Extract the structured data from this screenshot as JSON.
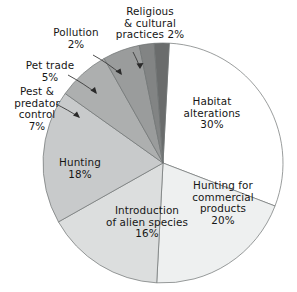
{
  "chart_data": {
    "type": "pie",
    "title": "",
    "subtitle": "",
    "xlabel": "",
    "ylabel": "",
    "legend_position": "none",
    "grid": false,
    "units": "percent",
    "total": 100,
    "start_angle_deg": 3,
    "direction": "clockwise",
    "categories": [
      "Habitat alterations",
      "Hunting for commercial products",
      "Introduction of alien species",
      "Hunting",
      "Pest & predator control",
      "Pet trade",
      "Pollution",
      "Religious & cultural practices"
    ],
    "values": [
      30,
      20,
      16,
      18,
      7,
      5,
      2,
      2
    ],
    "slices": [
      {
        "name": "Habitat alterations",
        "label_line1": "Habitat",
        "label_line2": "alterations",
        "label_value": "30%",
        "value": 30,
        "color": "#ffffff",
        "label_placement": "inside"
      },
      {
        "name": "Hunting for commercial products",
        "label_line1": "Hunting for",
        "label_line2": "commercial",
        "label_line3": "products",
        "label_value": "20%",
        "value": 20,
        "color": "#eef0f0",
        "label_placement": "inside"
      },
      {
        "name": "Introduction of alien species",
        "label_line1": "Introduction",
        "label_line2": "of alien species",
        "label_value": "16%",
        "value": 16,
        "color": "#dcdede",
        "label_placement": "inside"
      },
      {
        "name": "Hunting",
        "label_line1": "Hunting",
        "label_value": "18%",
        "value": 18,
        "color": "#c8cacb",
        "label_placement": "inside"
      },
      {
        "name": "Pest & predator control",
        "label_line1": "Pest &",
        "label_line2": "predator",
        "label_line3": "control",
        "label_value": "7%",
        "value": 7,
        "color": "#adafaf",
        "label_placement": "outside"
      },
      {
        "name": "Pet trade",
        "label_line1": "Pet trade",
        "label_value": "5%",
        "value": 5,
        "color": "#9a9c9c",
        "label_placement": "outside"
      },
      {
        "name": "Pollution",
        "label_line1": "Pollution",
        "label_value": "2%",
        "value": 2,
        "color": "#828484",
        "label_placement": "outside"
      },
      {
        "name": "Religious & cultural practices",
        "label_line1": "Religious",
        "label_line2": "& cultural",
        "label_line3": "practices 2%",
        "label_value": "2%",
        "value": 2,
        "color": "#6a6c6c",
        "label_placement": "outside"
      }
    ]
  },
  "labels": {
    "habitat": "Habitat\nalterations\n30%",
    "commercial": "Hunting for\ncommercial\nproducts\n20%",
    "alien": "Introduction\nof alien species\n16%",
    "hunting": "Hunting\n18%",
    "pest_predator": "Pest &\npredator\ncontrol\n7%",
    "pet_trade": "Pet trade\n5%",
    "pollution": "Pollution\n2%",
    "religious": "Religious\n& cultural\npractices 2%"
  },
  "colors": {
    "outline": "#6e7273",
    "leader": "#2a2a2a",
    "text": "#161616",
    "background": "#ffffff"
  }
}
